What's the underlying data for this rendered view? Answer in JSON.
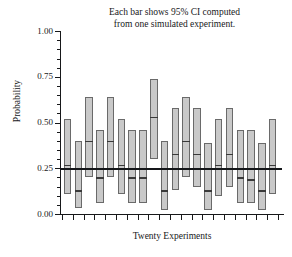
{
  "chart_data": {
    "type": "bar",
    "title": "Each bar shows  95% CI computed from one simulated experiment.",
    "title_lines": [
      "Each bar shows  95% CI computed",
      "from one simulated experiment."
    ],
    "xlabel": "Twenty Experiments",
    "ylabel": "Probability",
    "ylim": [
      0.0,
      1.0
    ],
    "ytick_labels": [
      "0.00",
      "0.25",
      "0.50",
      "0.75",
      "1.00"
    ],
    "ytick_values": [
      0.0,
      0.25,
      0.5,
      0.75,
      1.0
    ],
    "yminor_step": 0.05,
    "grid": false,
    "legend": null,
    "reference_line": {
      "value": 0.25,
      "label": "true probability",
      "color": "#15171a"
    },
    "bar_fill_color": "#c9c9c9",
    "bar_edge_color": "#6a6a6a",
    "point_estimate_color": "#3a3a3a",
    "n_experiments": 20,
    "n_xticks": 21,
    "categories": [
      "1",
      "2",
      "3",
      "4",
      "5",
      "6",
      "7",
      "8",
      "9",
      "10",
      "11",
      "12",
      "13",
      "14",
      "15",
      "16",
      "17",
      "18",
      "19",
      "20"
    ],
    "series": [
      {
        "name": "95% CI",
        "lower": [
          0.11,
          0.03,
          0.2,
          0.06,
          0.2,
          0.11,
          0.06,
          0.06,
          0.3,
          0.02,
          0.13,
          0.2,
          0.15,
          0.02,
          0.1,
          0.15,
          0.06,
          0.06,
          0.02,
          0.11
        ],
        "upper": [
          0.52,
          0.4,
          0.64,
          0.46,
          0.64,
          0.52,
          0.46,
          0.46,
          0.74,
          0.4,
          0.58,
          0.64,
          0.58,
          0.39,
          0.52,
          0.58,
          0.46,
          0.46,
          0.39,
          0.52
        ],
        "point": [
          0.27,
          0.13,
          0.4,
          0.2,
          0.4,
          0.27,
          0.2,
          0.2,
          0.53,
          0.13,
          0.33,
          0.4,
          0.33,
          0.13,
          0.27,
          0.33,
          0.2,
          0.19,
          0.13,
          0.27
        ]
      }
    ]
  }
}
